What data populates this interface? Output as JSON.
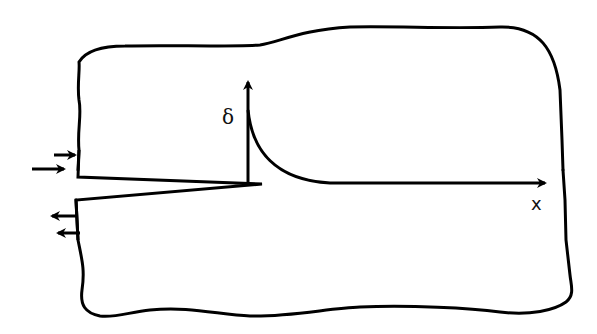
{
  "diagram": {
    "labels": {
      "vertical_axis": "δ",
      "horizontal_axis": "x"
    },
    "colors": {
      "stroke": "#000000",
      "background": "#ffffff"
    },
    "elements": {
      "plate_outline": "irregular plate boundary",
      "crack": "wedge-shaped edge crack from left boundary",
      "load_arrows_top": "two arrows pointing right on upper crack face",
      "load_arrows_bottom": "two arrows pointing left on lower crack face",
      "displacement_curve": "decaying curve from delta axis toward x axis"
    }
  }
}
